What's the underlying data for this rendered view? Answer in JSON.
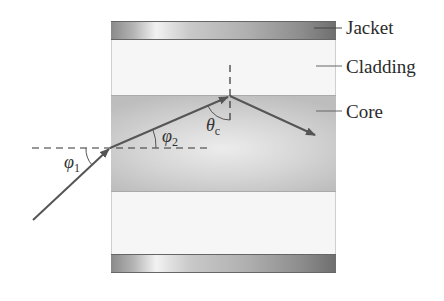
{
  "diagram": {
    "layers": {
      "jacket": {
        "label": "Jacket"
      },
      "cladding": {
        "label": "Cladding"
      },
      "core": {
        "label": "Core"
      }
    },
    "angles": {
      "phi1": {
        "symbol": "φ",
        "subscript": "1"
      },
      "phi2": {
        "symbol": "φ",
        "subscript": "2"
      },
      "theta_c": {
        "symbol": "θ",
        "subscript": "c"
      }
    },
    "colors": {
      "ray": "#555555",
      "dashed_line": "#333333",
      "cladding": "#f6f6f6",
      "core": "#d6d6d6",
      "jacket": "#9a9a9a"
    }
  }
}
